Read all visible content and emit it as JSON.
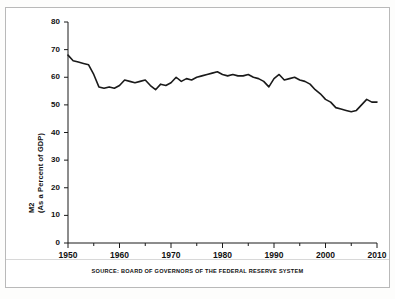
{
  "figure": {
    "background": "#ffffff",
    "border_color": "#b9b9b9",
    "source_note": "SOURCE: BOARD OF GOVERNORS OF THE FEDERAL RESERVE SYSTEM"
  },
  "axis": {
    "ylabel_line1": "M2",
    "ylabel_line2": "(As a Percent of GDP)",
    "y_ticks": [
      "0",
      "10",
      "20",
      "30",
      "40",
      "50",
      "60",
      "70",
      "80"
    ],
    "x_ticks": [
      "1950",
      "1960",
      "1970",
      "1980",
      "1990",
      "2000",
      "2010"
    ]
  },
  "chart_data": {
    "type": "line",
    "title": "",
    "subtitle": "",
    "xlabel": "",
    "ylabel": "M2 (As a Percent of GDP)",
    "xlim": [
      1950,
      2010
    ],
    "ylim": [
      0,
      80
    ],
    "ytick_values": [
      0,
      10,
      20,
      30,
      40,
      50,
      60,
      70,
      80
    ],
    "xtick_values": [
      1950,
      1960,
      1970,
      1980,
      1990,
      2000,
      2010
    ],
    "x_minor_tick_interval": 5,
    "grid": false,
    "legend": "none",
    "line_color": "#1a1a1a",
    "line_width": 1.6,
    "source": "BOARD OF GOVERNORS OF THE FEDERAL RESERVE SYSTEM",
    "series": [
      {
        "name": "M2 as a Percent of GDP",
        "x": [
          1950,
          1951,
          1952,
          1953,
          1954,
          1955,
          1956,
          1957,
          1958,
          1959,
          1960,
          1961,
          1962,
          1963,
          1964,
          1965,
          1966,
          1967,
          1968,
          1969,
          1970,
          1971,
          1972,
          1973,
          1974,
          1975,
          1976,
          1977,
          1978,
          1979,
          1980,
          1981,
          1982,
          1983,
          1984,
          1985,
          1986,
          1987,
          1988,
          1989,
          1990,
          1991,
          1992,
          1993,
          1994,
          1995,
          1996,
          1997,
          1998,
          1999,
          2000,
          2001,
          2002,
          2003,
          2004,
          2005,
          2006,
          2007,
          2008,
          2009,
          2010
        ],
        "values": [
          68.0,
          66.0,
          65.5,
          65.0,
          64.5,
          61.0,
          56.5,
          56.0,
          56.5,
          56.0,
          57.0,
          59.0,
          58.5,
          58.0,
          58.5,
          59.0,
          57.0,
          55.5,
          57.5,
          57.0,
          58.0,
          60.0,
          58.5,
          59.5,
          59.0,
          60.0,
          60.5,
          61.0,
          61.5,
          62.0,
          61.0,
          60.5,
          61.0,
          60.5,
          60.5,
          61.0,
          60.0,
          59.5,
          58.5,
          56.5,
          59.5,
          61.0,
          59.0,
          59.5,
          60.0,
          59.0,
          58.5,
          57.5,
          55.5,
          54.0,
          52.0,
          51.0,
          49.0,
          48.5,
          48.0,
          47.5,
          48.0,
          50.0,
          52.0,
          51.0,
          51.0
        ]
      }
    ]
  }
}
